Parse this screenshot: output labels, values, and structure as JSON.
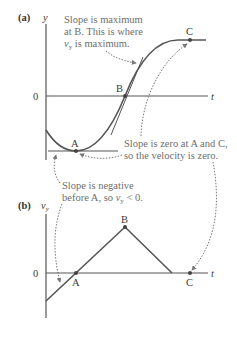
{
  "figure": {
    "panel_a": {
      "label": "(a)",
      "y_axis_label": "y",
      "x_axis_label": "t",
      "origin_label": "0",
      "points": {
        "A": "A",
        "B": "B",
        "C": "C"
      },
      "annotations": {
        "max_slope": [
          "Slope is maximum",
          "at B. This is where",
          "is maximum."
        ],
        "max_slope_var": "v",
        "max_slope_sub": "y",
        "zero_slope": [
          "Slope is zero at A and C,",
          "so the velocity is zero."
        ]
      }
    },
    "panel_b": {
      "label": "(b)",
      "y_axis_label": "v",
      "y_axis_sub": "y",
      "x_axis_label": "t",
      "origin_label": "0",
      "points": {
        "A": "A",
        "B": "B",
        "C": "C"
      },
      "annotations": {
        "negative_slope_line1": "Slope is negative",
        "negative_slope_line2_pre": "before A, so ",
        "negative_slope_var": "v",
        "negative_slope_sub": "y",
        "negative_slope_post": " < 0."
      }
    },
    "colors": {
      "curve": "#555555",
      "axis": "#555555",
      "annotation": "#777777",
      "point": "#444444"
    }
  }
}
